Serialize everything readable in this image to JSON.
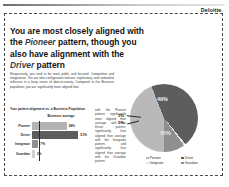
{
  "brand": {
    "name": "Deloitte",
    "punct": "."
  },
  "headline": {
    "part1": "You are most closely aligned with the ",
    "pattern1": "Pioneer",
    "part2": " pattern, though you also have alignment with the ",
    "pattern2": "Driver",
    "part3": " pattern"
  },
  "body": {
    "left": "Respectively, you tend to be most public and focused. Competitive and imaginative. You are also configuration-tolerant, exploratory, and somewhat reflective in a busy sense of data-to-variety. Compared to the Business population, you are significantly more aligned than",
    "right": "with the Pioneer pattern, significantly more aligned than average with the Driver pattern, significantly less aligned than average with the Integrator pattern, and significantly less aligned than average with the Guardian pattern."
  },
  "chart_subtitle": "Your pattern alignment vs. a Business Population",
  "chart_data": [
    {
      "type": "bar",
      "title": "Business average",
      "categories": [
        "Pioneer",
        "Driver",
        "Integrator",
        "Guardian"
      ],
      "values": [
        38,
        51,
        7,
        3
      ],
      "labels": [
        "38%",
        "51%",
        "7%",
        "3%"
      ],
      "xlabel": "",
      "ylabel": "",
      "xlim": [
        0,
        55
      ],
      "grid": false,
      "reference_line_value": 8,
      "colors": [
        "#b3b3b3",
        "#5d5d5d",
        "#8f8f8f",
        "#d0d0d0"
      ]
    },
    {
      "type": "pie",
      "title": "",
      "categories": [
        "Pioneer",
        "Driver",
        "Integrator",
        "Guardian"
      ],
      "values": [
        49,
        45,
        1,
        5
      ],
      "labels": [
        "49%",
        "45%",
        "1%",
        "5%"
      ],
      "colors": [
        "#b9b9b9",
        "#5d5d5d",
        "#e5e5e5",
        "#8f8f8f"
      ],
      "legend_position": "bottom"
    }
  ]
}
